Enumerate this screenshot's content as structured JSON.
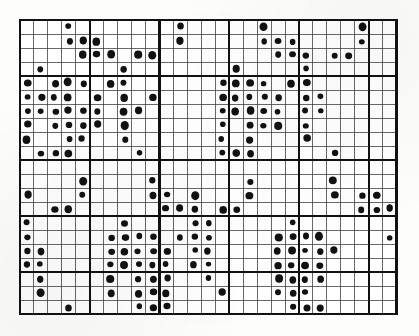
{
  "figure": {
    "kind": "dot-matrix-grid-plot",
    "background_color": "#fdfdfc",
    "dot_color": "#111111",
    "thin_line_color": "#3a3a3a",
    "thick_line_color": "#111111",
    "border_color": "#111111"
  },
  "chart_data": {
    "type": "heatmap",
    "title": "",
    "subtitle": "",
    "xlabel": "",
    "ylabel": "",
    "legend": [],
    "annotations": [],
    "grid": true,
    "grid_origin_x": 20,
    "grid_origin_y": 20,
    "cell_width": 13.95,
    "cell_height": 14.0,
    "n_cols": 27,
    "n_rows": 21,
    "xlim": [
      0,
      27
    ],
    "ylim": [
      0,
      21
    ],
    "x_tick_labels": [],
    "y_tick_labels": [],
    "major_col_lines": [
      0,
      5,
      10,
      15,
      20,
      25,
      27
    ],
    "major_row_lines": [
      0,
      4,
      10,
      14,
      18,
      21
    ],
    "dot_radius": 3.3,
    "value_filled": 1,
    "value_empty": 0,
    "points": [
      [
        3,
        1
      ],
      [
        11,
        1
      ],
      [
        17,
        1
      ],
      [
        24,
        1
      ],
      [
        3,
        2
      ],
      [
        4,
        2
      ],
      [
        5,
        2
      ],
      [
        11,
        2
      ],
      [
        17,
        2
      ],
      [
        18,
        2
      ],
      [
        19,
        2
      ],
      [
        24,
        2
      ],
      [
        4,
        3
      ],
      [
        5,
        3
      ],
      [
        6,
        3
      ],
      [
        8,
        3
      ],
      [
        9,
        3
      ],
      [
        18,
        3
      ],
      [
        19,
        3
      ],
      [
        20,
        3
      ],
      [
        22,
        3
      ],
      [
        23,
        3
      ],
      [
        1,
        4
      ],
      [
        7,
        4
      ],
      [
        15,
        4
      ],
      [
        20,
        4
      ],
      [
        0,
        5
      ],
      [
        2,
        5
      ],
      [
        3,
        5
      ],
      [
        4,
        5
      ],
      [
        6,
        5
      ],
      [
        7,
        5
      ],
      [
        14,
        5
      ],
      [
        15,
        5
      ],
      [
        16,
        5
      ],
      [
        17,
        5
      ],
      [
        19,
        5
      ],
      [
        20,
        5
      ],
      [
        0,
        6
      ],
      [
        1,
        6
      ],
      [
        2,
        6
      ],
      [
        3,
        6
      ],
      [
        5,
        6
      ],
      [
        7,
        6
      ],
      [
        9,
        6
      ],
      [
        14,
        6
      ],
      [
        15,
        6
      ],
      [
        16,
        6
      ],
      [
        17,
        6
      ],
      [
        18,
        6
      ],
      [
        20,
        6
      ],
      [
        21,
        6
      ],
      [
        0,
        7
      ],
      [
        1,
        7
      ],
      [
        2,
        7
      ],
      [
        3,
        7
      ],
      [
        4,
        7
      ],
      [
        5,
        7
      ],
      [
        7,
        7
      ],
      [
        8,
        7
      ],
      [
        14,
        7
      ],
      [
        15,
        7
      ],
      [
        16,
        7
      ],
      [
        17,
        7
      ],
      [
        18,
        7
      ],
      [
        20,
        7
      ],
      [
        21,
        7
      ],
      [
        0,
        8
      ],
      [
        2,
        8
      ],
      [
        3,
        8
      ],
      [
        4,
        8
      ],
      [
        5,
        8
      ],
      [
        7,
        8
      ],
      [
        14,
        8
      ],
      [
        16,
        8
      ],
      [
        17,
        8
      ],
      [
        18,
        8
      ],
      [
        20,
        8
      ],
      [
        0,
        9
      ],
      [
        3,
        9
      ],
      [
        4,
        9
      ],
      [
        7,
        9
      ],
      [
        14,
        9
      ],
      [
        16,
        9
      ],
      [
        20,
        9
      ],
      [
        1,
        10
      ],
      [
        2,
        10
      ],
      [
        3,
        10
      ],
      [
        8,
        10
      ],
      [
        14,
        10
      ],
      [
        15,
        10
      ],
      [
        16,
        10
      ],
      [
        22,
        10
      ],
      [
        4,
        12
      ],
      [
        9,
        12
      ],
      [
        16,
        12
      ],
      [
        22,
        12
      ],
      [
        0,
        13
      ],
      [
        4,
        13
      ],
      [
        9,
        13
      ],
      [
        10,
        13
      ],
      [
        12,
        13
      ],
      [
        16,
        13
      ],
      [
        22,
        13
      ],
      [
        24,
        13
      ],
      [
        25,
        13
      ],
      [
        2,
        14
      ],
      [
        3,
        14
      ],
      [
        10,
        14
      ],
      [
        11,
        14
      ],
      [
        12,
        14
      ],
      [
        14,
        14
      ],
      [
        15,
        14
      ],
      [
        24,
        14
      ],
      [
        25,
        14
      ],
      [
        26,
        14
      ],
      [
        0,
        15
      ],
      [
        7,
        15
      ],
      [
        12,
        15
      ],
      [
        13,
        15
      ],
      [
        19,
        15
      ],
      [
        0,
        16
      ],
      [
        6,
        16
      ],
      [
        7,
        16
      ],
      [
        8,
        16
      ],
      [
        9,
        16
      ],
      [
        11,
        16
      ],
      [
        12,
        16
      ],
      [
        13,
        16
      ],
      [
        18,
        16
      ],
      [
        19,
        16
      ],
      [
        20,
        16
      ],
      [
        21,
        16
      ],
      [
        26,
        16
      ],
      [
        0,
        17
      ],
      [
        1,
        17
      ],
      [
        6,
        17
      ],
      [
        7,
        17
      ],
      [
        8,
        17
      ],
      [
        9,
        17
      ],
      [
        10,
        17
      ],
      [
        12,
        17
      ],
      [
        13,
        17
      ],
      [
        18,
        17
      ],
      [
        19,
        17
      ],
      [
        20,
        17
      ],
      [
        21,
        17
      ],
      [
        22,
        17
      ],
      [
        0,
        18
      ],
      [
        1,
        18
      ],
      [
        6,
        18
      ],
      [
        7,
        18
      ],
      [
        8,
        18
      ],
      [
        9,
        18
      ],
      [
        10,
        18
      ],
      [
        12,
        18
      ],
      [
        13,
        18
      ],
      [
        18,
        18
      ],
      [
        19,
        18
      ],
      [
        20,
        18
      ],
      [
        21,
        18
      ],
      [
        1,
        19
      ],
      [
        6,
        19
      ],
      [
        8,
        19
      ],
      [
        9,
        19
      ],
      [
        10,
        19
      ],
      [
        13,
        19
      ],
      [
        18,
        19
      ],
      [
        19,
        19
      ],
      [
        20,
        19
      ],
      [
        21,
        19
      ],
      [
        1,
        20
      ],
      [
        6,
        20
      ],
      [
        8,
        20
      ],
      [
        9,
        20
      ],
      [
        10,
        20
      ],
      [
        14,
        20
      ],
      [
        18,
        20
      ],
      [
        19,
        20
      ],
      [
        20,
        20
      ],
      [
        3,
        21
      ],
      [
        8,
        21
      ],
      [
        9,
        21
      ],
      [
        10,
        21
      ],
      [
        19,
        21
      ],
      [
        20,
        21
      ],
      [
        21,
        21
      ]
    ]
  }
}
